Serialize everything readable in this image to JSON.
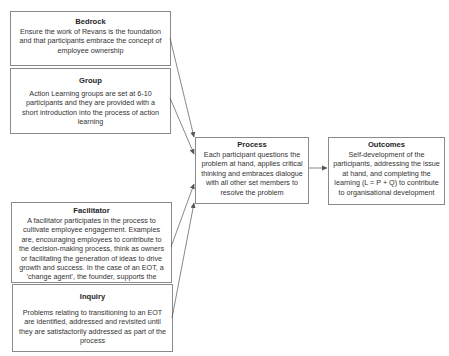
{
  "diagram": {
    "nodes": {
      "bedrock": {
        "title": "Bedrock",
        "body": "Ensure the work of Revans is the foundation and that participants embrace the concept of employee ownership"
      },
      "group": {
        "title": "Group",
        "body": "Action Learning groups are set at 6-10 participants and they are provided with a short introduction into the process of action learning"
      },
      "facilitator": {
        "title": "Facilitator",
        "body": "A facilitator participates in the process to cultivate employee engagement. Examples are, encouraging employees to contribute to the decision-making process, think as owners or facilitating the generation of ideas to drive growth and success. In the case of an EOT, a 'change agent', the founder, supports the facitation process."
      },
      "inquiry": {
        "title": "Inquiry",
        "body": "Problems relating to transitioning to an EOT are identified, addressed and revisited until they are satisfactorily addressed as part of the process"
      },
      "process": {
        "title": "Process",
        "body": "Each participant questions the problem at hand, applies critical thinking and embraces dialogue with all other set members to resolve the problem"
      },
      "outcomes": {
        "title": "Outcomes",
        "body": "Self-development of the participants, addressing the issue at hand, and completing the learning (L = P + Q) to contribute to organisational development"
      }
    },
    "edges": [
      {
        "from": "Bedrock",
        "to": "Process"
      },
      {
        "from": "Group",
        "to": "Process"
      },
      {
        "from": "Facilitator",
        "to": "Process"
      },
      {
        "from": "Inquiry",
        "to": "Process"
      },
      {
        "from": "Process",
        "to": "Outcomes"
      }
    ],
    "colors": {
      "border": "#8a8a8a",
      "arrow": "#555555",
      "text": "#2a2a2a"
    }
  }
}
